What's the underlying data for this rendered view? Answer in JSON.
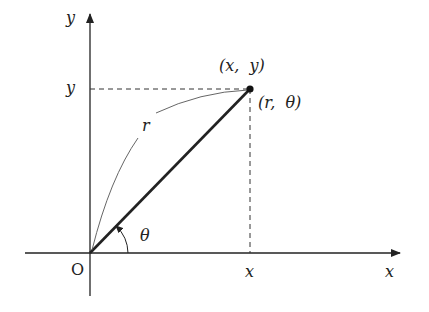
{
  "diagram": {
    "type": "polar-cartesian-coordinates",
    "colors": {
      "stroke": "#222222",
      "thin_stroke": "#444444",
      "background": "#ffffff"
    },
    "origin": {
      "label": "O",
      "px": [
        90,
        253
      ]
    },
    "axes": {
      "x": {
        "label": "x",
        "from_px": [
          25,
          253
        ],
        "to_px": [
          400,
          253
        ]
      },
      "y": {
        "label": "y",
        "from_px": [
          90,
          296
        ],
        "to_px": [
          90,
          14
        ]
      }
    },
    "point": {
      "px": [
        250,
        89
      ],
      "cartesian_label": "(x,  y)",
      "polar_label": "(r,  θ)"
    },
    "projections": {
      "x_tick_label": "x",
      "y_tick_label": "y"
    },
    "radius": {
      "label": "r"
    },
    "angle": {
      "label": "θ"
    }
  },
  "labels": {
    "y_axis": "y",
    "y_tick": "y",
    "x_axis": "x",
    "x_tick": "x",
    "origin": "O",
    "cartesian_point": "(x,  y)",
    "polar_point": "(r,  θ)",
    "radius": "r",
    "angle": "θ"
  }
}
